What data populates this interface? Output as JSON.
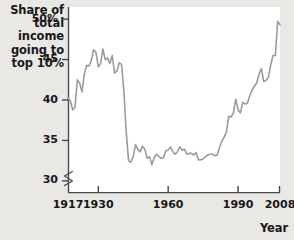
{
  "chart_data": {
    "type": "line",
    "ylabel": "Share of total income going to top 10%",
    "xlabel": "Year",
    "xlim": [
      1917,
      2008
    ],
    "ylim": [
      28.5,
      51.5
    ],
    "grid": false,
    "legend": null,
    "axis_break": true,
    "axis_break_note": "y-axis broken below 30",
    "ytick_labels": [
      "50%",
      "45",
      "40",
      "35",
      "30"
    ],
    "ytick_values": [
      50,
      45,
      40,
      35,
      30
    ],
    "xtick_labels": [
      "1917",
      "1930",
      "1960",
      "1990",
      "2008"
    ],
    "xtick_values": [
      1917,
      1930,
      1960,
      1990,
      2008
    ],
    "line_color": "#9b9b9b",
    "series_name": "Share of total income going to top 10%",
    "x": [
      1917,
      1918,
      1919,
      1920,
      1921,
      1922,
      1923,
      1924,
      1925,
      1926,
      1927,
      1928,
      1929,
      1930,
      1931,
      1932,
      1933,
      1934,
      1935,
      1936,
      1937,
      1938,
      1939,
      1940,
      1941,
      1942,
      1943,
      1944,
      1945,
      1946,
      1947,
      1948,
      1949,
      1950,
      1951,
      1952,
      1953,
      1954,
      1955,
      1956,
      1957,
      1958,
      1959,
      1960,
      1961,
      1962,
      1963,
      1964,
      1965,
      1966,
      1967,
      1968,
      1969,
      1970,
      1971,
      1972,
      1973,
      1974,
      1975,
      1976,
      1977,
      1978,
      1979,
      1980,
      1981,
      1982,
      1983,
      1984,
      1985,
      1986,
      1987,
      1988,
      1989,
      1990,
      1991,
      1992,
      1993,
      1994,
      1995,
      1996,
      1997,
      1998,
      1999,
      2000,
      2001,
      2002,
      2003,
      2004,
      2005,
      2006,
      2007,
      2008
    ],
    "y": [
      40.3,
      39.9,
      38.8,
      39.1,
      42.5,
      42.1,
      41.0,
      43.2,
      44.3,
      44.2,
      44.9,
      46.2,
      45.9,
      44.1,
      44.5,
      46.3,
      45.0,
      45.2,
      44.5,
      45.5,
      43.3,
      43.6,
      44.6,
      44.4,
      41.0,
      36.0,
      32.5,
      32.3,
      33.0,
      34.5,
      33.9,
      33.6,
      34.3,
      33.9,
      32.8,
      33.0,
      32.0,
      32.9,
      33.3,
      33.0,
      32.8,
      32.9,
      33.7,
      33.8,
      34.2,
      33.6,
      33.3,
      33.6,
      34.2,
      33.8,
      33.9,
      33.3,
      33.4,
      33.4,
      33.2,
      33.5,
      32.6,
      32.6,
      32.7,
      33.0,
      33.2,
      33.3,
      33.3,
      33.1,
      33.2,
      34.1,
      34.9,
      35.4,
      36.0,
      38.0,
      37.9,
      38.4,
      40.1,
      38.8,
      38.4,
      39.7,
      39.5,
      39.6,
      40.5,
      41.2,
      41.7,
      42.1,
      43.2,
      43.9,
      42.3,
      42.4,
      42.8,
      44.3,
      45.5,
      45.5,
      49.7,
      49.3
    ]
  },
  "labels": {
    "y_title": "Share of\ntotal income\ngoing to\ntop 10%",
    "x_title": "Year"
  }
}
